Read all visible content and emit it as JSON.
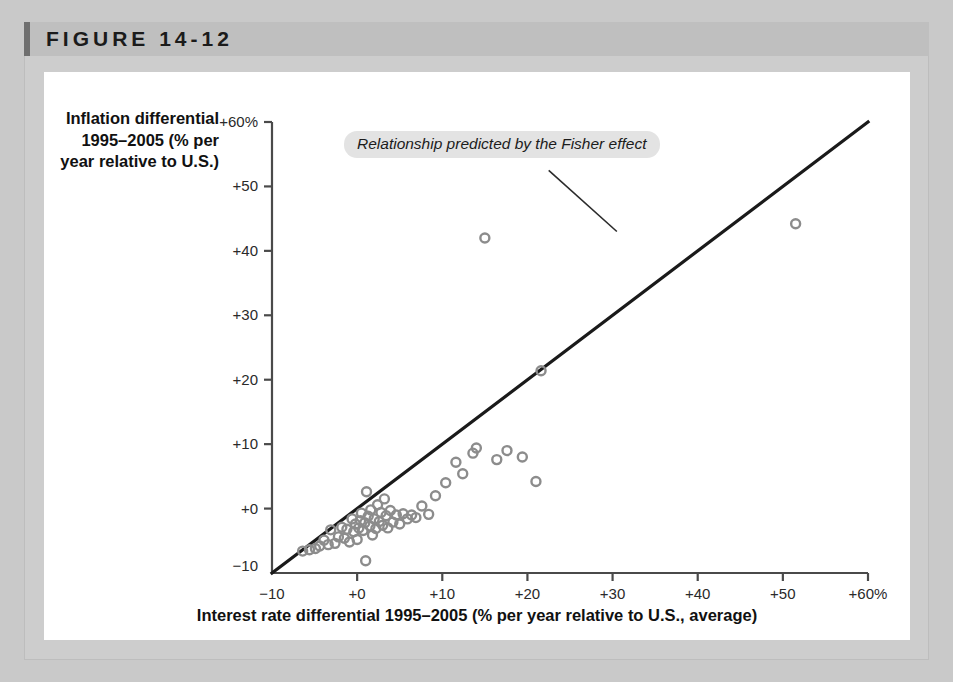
{
  "figure": {
    "label": "FIGURE 14-12"
  },
  "chart_data": {
    "type": "scatter",
    "title": "FIGURE 14-12",
    "xlabel": "Interest rate differential 1995–2005 (% per year relative to U.S., average)",
    "ylabel": "Inflation differential 1995–2005 (% per year relative to U.S.)",
    "xlim": [
      -10,
      60
    ],
    "ylim": [
      -10,
      60
    ],
    "grid": false,
    "xticks": [
      -10,
      0,
      10,
      20,
      30,
      40,
      50,
      60
    ],
    "yticks": [
      -10,
      0,
      10,
      20,
      30,
      40,
      50,
      60
    ],
    "xtick_labels": [
      "−10",
      "+0",
      "+10",
      "+20",
      "+30",
      "+40",
      "+50",
      "+60%"
    ],
    "ytick_labels": [
      "−10",
      "+0",
      "+10",
      "+20",
      "+30",
      "+40",
      "+50",
      "+60%"
    ],
    "annotations": [
      {
        "text": "Relationship predicted by the Fisher effect",
        "style": "italic-pill",
        "leader_from": [
          22.5,
          52.5
        ],
        "leader_to": [
          30.5,
          43.0
        ]
      }
    ],
    "reference_line": {
      "name": "Relationship predicted by the Fisher effect",
      "from": [
        -10,
        -10
      ],
      "to": [
        60,
        60
      ],
      "color": "#1a1a1a",
      "width": 3.2
    },
    "marker": {
      "shape": "open-circle",
      "color": "#8c8c8c",
      "size": 9
    },
    "points": [
      [
        -6.4,
        -6.6
      ],
      [
        -5.6,
        -6.4
      ],
      [
        -4.9,
        -6.2
      ],
      [
        -4.4,
        -5.8
      ],
      [
        -3.9,
        -4.9
      ],
      [
        -3.4,
        -5.6
      ],
      [
        -3.1,
        -3.3
      ],
      [
        -2.6,
        -5.4
      ],
      [
        -2.2,
        -4.4
      ],
      [
        -1.8,
        -2.9
      ],
      [
        -1.5,
        -4.6
      ],
      [
        -1.2,
        -3.2
      ],
      [
        -0.9,
        -5.2
      ],
      [
        -0.6,
        -1.6
      ],
      [
        -0.4,
        -3.6
      ],
      [
        -0.2,
        -2.4
      ],
      [
        0.0,
        -4.8
      ],
      [
        0.2,
        -3.0
      ],
      [
        0.4,
        -1.9
      ],
      [
        0.5,
        -0.7
      ],
      [
        0.7,
        -3.4
      ],
      [
        0.9,
        -2.2
      ],
      [
        1.0,
        -8.1
      ],
      [
        1.1,
        2.6
      ],
      [
        1.3,
        -1.2
      ],
      [
        1.5,
        -2.7
      ],
      [
        1.6,
        -0.2
      ],
      [
        1.8,
        -4.1
      ],
      [
        2.0,
        -1.6
      ],
      [
        2.2,
        -3.1
      ],
      [
        2.4,
        0.6
      ],
      [
        2.6,
        -2.0
      ],
      [
        2.8,
        -0.6
      ],
      [
        3.0,
        -2.6
      ],
      [
        3.2,
        1.5
      ],
      [
        3.4,
        -1.1
      ],
      [
        3.6,
        -3.0
      ],
      [
        3.9,
        -0.3
      ],
      [
        4.2,
        -2.1
      ],
      [
        4.6,
        -1.0
      ],
      [
        5.0,
        -2.4
      ],
      [
        5.4,
        -0.8
      ],
      [
        5.9,
        -1.6
      ],
      [
        6.4,
        -1.0
      ],
      [
        6.9,
        -1.4
      ],
      [
        7.6,
        0.4
      ],
      [
        8.4,
        -0.9
      ],
      [
        9.2,
        2.0
      ],
      [
        10.4,
        4.0
      ],
      [
        11.6,
        7.2
      ],
      [
        12.4,
        5.4
      ],
      [
        13.6,
        8.6
      ],
      [
        14.0,
        9.4
      ],
      [
        15.0,
        42.0
      ],
      [
        16.4,
        7.6
      ],
      [
        17.6,
        9.0
      ],
      [
        19.4,
        8.0
      ],
      [
        21.0,
        4.2
      ],
      [
        21.6,
        21.4
      ],
      [
        51.5,
        44.2
      ]
    ]
  }
}
